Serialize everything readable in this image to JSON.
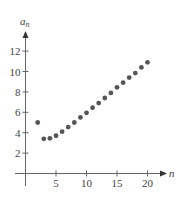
{
  "chart_data": {
    "type": "scatter",
    "title": "",
    "xlabel": "n",
    "ylabel": "a_n",
    "ylabel_main": "a",
    "ylabel_sub": "n",
    "xlim": [
      0,
      22
    ],
    "ylim": [
      0,
      13
    ],
    "x_ticks": [
      5,
      10,
      15,
      20
    ],
    "x_tick_labels": [
      "5",
      "10",
      "15",
      "20"
    ],
    "y_ticks": [
      2,
      4,
      6,
      8,
      10,
      12
    ],
    "y_tick_labels": [
      "2",
      "4",
      "6",
      "8",
      "10",
      "12"
    ],
    "grid": false,
    "legend": null,
    "point_color": "#555555",
    "axis_color": "#555555",
    "series": [
      {
        "name": "a_n",
        "x": [
          2,
          3,
          4,
          5,
          6,
          7,
          8,
          9,
          10,
          11,
          12,
          13,
          14,
          15,
          16,
          17,
          18,
          19,
          20
        ],
        "values": [
          5.0,
          3.4,
          3.45,
          3.7,
          4.1,
          4.55,
          5.0,
          5.5,
          5.95,
          6.45,
          6.9,
          7.4,
          7.9,
          8.45,
          8.9,
          9.4,
          9.85,
          10.4,
          10.9
        ]
      }
    ]
  }
}
